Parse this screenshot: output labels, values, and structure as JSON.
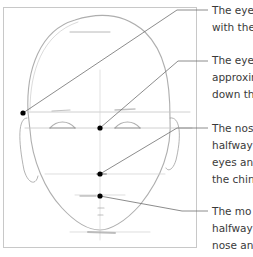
{
  "diagram": {
    "annotations": [
      {
        "id": "eye-line",
        "lines": [
          "The eye",
          "with the"
        ]
      },
      {
        "id": "eye-spacing",
        "lines": [
          "The eye",
          "approxin",
          "down th"
        ]
      },
      {
        "id": "nose-position",
        "lines": [
          "The nos",
          "halfway",
          "eyes and",
          "the chin"
        ]
      },
      {
        "id": "mouth-position",
        "lines": [
          "The mo",
          "halfway",
          "nose an"
        ]
      }
    ],
    "colors": {
      "frame": "#c8c8c8",
      "leader": "#6f6f6f",
      "dot": "#000000",
      "sketch": "#9a9a9a",
      "text": "#3a3a3a"
    }
  }
}
